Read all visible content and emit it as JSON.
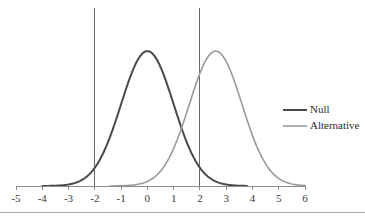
{
  "chart_data": {
    "type": "line",
    "title": "",
    "subtitle": "",
    "xlabel": "",
    "ylabel": "",
    "xlim": [
      -5,
      6
    ],
    "ylim": [
      0,
      0.42
    ],
    "grid": false,
    "legend_position": "right",
    "xticks": [
      "-5",
      "-4",
      "-3",
      "-2",
      "-1",
      "0",
      "1",
      "2",
      "3",
      "4",
      "5",
      "6"
    ],
    "xtick_values": [
      -5,
      -4,
      -3,
      -2,
      -1,
      0,
      1,
      2,
      3,
      4,
      5,
      6
    ],
    "yticks": [],
    "series": [
      {
        "name": "Null",
        "distribution": "normal",
        "mean": 0,
        "sd": 1,
        "peak_value": 0.399,
        "color": "#4a4a4a",
        "line_width": 2.0,
        "x_start": -4.0,
        "x_end": 3.8,
        "x": [
          -4.0,
          -3.6,
          -3.2,
          -2.8,
          -2.4,
          -2.0,
          -1.6,
          -1.2,
          -0.8,
          -0.4,
          0.0,
          0.4,
          0.8,
          1.2,
          1.6,
          2.0,
          2.4,
          2.8,
          3.2,
          3.6,
          3.8
        ],
        "values": [
          0.0001,
          0.0006,
          0.0024,
          0.0079,
          0.0224,
          0.054,
          0.1109,
          0.1942,
          0.2897,
          0.3683,
          0.3989,
          0.3683,
          0.2897,
          0.1942,
          0.1109,
          0.054,
          0.0224,
          0.0079,
          0.0024,
          0.0006,
          0.0003
        ]
      },
      {
        "name": "Alternative",
        "distribution": "normal",
        "mean": 2.6,
        "sd": 1,
        "peak_value": 0.399,
        "color": "#9a9a9a",
        "line_width": 1.6,
        "x_start": -1.4,
        "x_end": 6.0,
        "x": [
          -1.4,
          -1.0,
          -0.6,
          -0.2,
          0.2,
          0.6,
          1.0,
          1.4,
          1.8,
          2.2,
          2.6,
          3.0,
          3.4,
          3.8,
          4.2,
          4.6,
          5.0,
          5.4,
          5.8,
          6.0
        ],
        "values": [
          0.0001,
          0.0006,
          0.0024,
          0.0079,
          0.0224,
          0.054,
          0.1109,
          0.1942,
          0.2897,
          0.3683,
          0.3989,
          0.3683,
          0.2897,
          0.1942,
          0.1109,
          0.054,
          0.0224,
          0.0079,
          0.0024,
          0.0013
        ]
      }
    ],
    "annotations": [
      {
        "name": "critical-value-line-left",
        "type": "vertical-line",
        "x": -2,
        "color": "#6b6b6b"
      },
      {
        "name": "critical-value-line-right",
        "type": "vertical-line",
        "x": 2,
        "color": "#6b6b6b"
      }
    ],
    "legend": [
      {
        "label": "Null",
        "color": "#4a4a4a",
        "line_width": 2.0
      },
      {
        "label": "Alternative",
        "color": "#9a9a9a",
        "line_width": 1.6
      }
    ]
  },
  "legend": {
    "entries": [
      {
        "label": "Null"
      },
      {
        "label": "Alternative"
      }
    ]
  },
  "axis": {
    "xticks": [
      "-5",
      "-4",
      "-3",
      "-2",
      "-1",
      "0",
      "1",
      "2",
      "3",
      "4",
      "5",
      "6"
    ]
  }
}
